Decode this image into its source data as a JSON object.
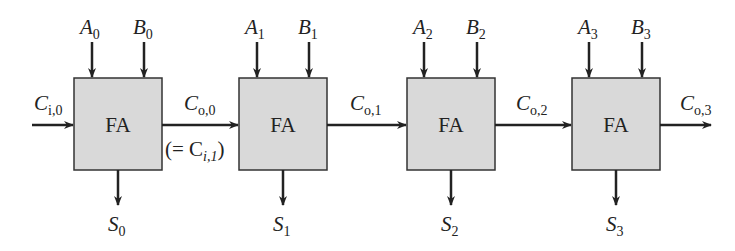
{
  "diagram": {
    "block_label": "FA",
    "colors": {
      "block_fill": "#d9d9d9",
      "stroke": "#222222",
      "background": "#ffffff"
    },
    "carry_in": {
      "main": "C",
      "sub": "i,0"
    },
    "equivalence_note": {
      "prefix": "(= C",
      "sub": "i,1",
      "suffix": ")"
    },
    "blocks": [
      {
        "a": {
          "main": "A",
          "sub": "0"
        },
        "b": {
          "main": "B",
          "sub": "0"
        },
        "s": {
          "main": "S",
          "sub": "0"
        },
        "cout": {
          "main": "C",
          "sub": "o,0"
        }
      },
      {
        "a": {
          "main": "A",
          "sub": "1"
        },
        "b": {
          "main": "B",
          "sub": "1"
        },
        "s": {
          "main": "S",
          "sub": "1"
        },
        "cout": {
          "main": "C",
          "sub": "o,1"
        }
      },
      {
        "a": {
          "main": "A",
          "sub": "2"
        },
        "b": {
          "main": "B",
          "sub": "2"
        },
        "s": {
          "main": "S",
          "sub": "2"
        },
        "cout": {
          "main": "C",
          "sub": "o,2"
        }
      },
      {
        "a": {
          "main": "A",
          "sub": "3"
        },
        "b": {
          "main": "B",
          "sub": "3"
        },
        "s": {
          "main": "S",
          "sub": "3"
        },
        "cout": {
          "main": "C",
          "sub": "o,3"
        }
      }
    ]
  }
}
